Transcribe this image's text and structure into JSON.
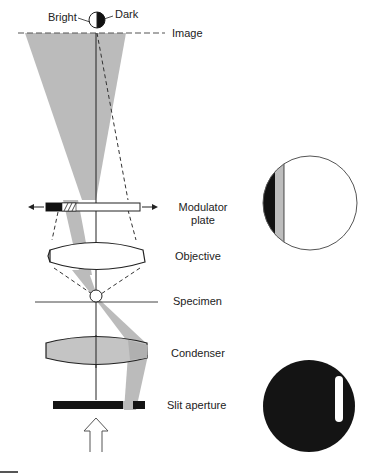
{
  "figure": {
    "labels": {
      "bright": "Bright",
      "dark": "Dark",
      "image": "Image",
      "modulator_line1": "Modulator",
      "modulator_line2": "plate",
      "objective": "Objective",
      "specimen": "Specimen",
      "condenser": "Condenser",
      "slit_aperture": "Slit aperture"
    },
    "insets": [
      {
        "name": "modulator-plate-view",
        "description": "Circle with dark, gray and clear zones"
      },
      {
        "name": "slit-aperture-view",
        "description": "Dark disc with off-axis clear slit"
      }
    ],
    "colors": {
      "beam_gray": "#b8b8b8",
      "dark_zone": "#111111",
      "gray_zone": "#bdbdbd",
      "line": "#222222",
      "background": "#ffffff"
    }
  }
}
